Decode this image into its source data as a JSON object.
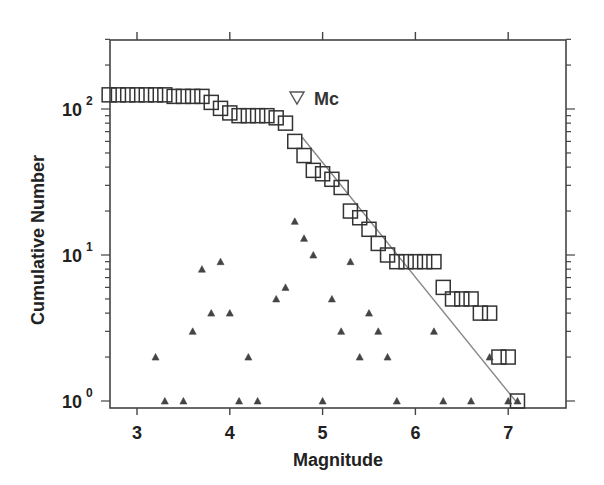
{
  "chart_data": {
    "type": "scatter",
    "title": "",
    "xlabel": "Magnitude",
    "ylabel": "Cumulative Number",
    "yscale": "log",
    "xlim": [
      2.7,
      7.6
    ],
    "ylim": [
      0.9,
      330
    ],
    "grid": false,
    "x_ticks": [
      3,
      4,
      5,
      6,
      7
    ],
    "x_tick_labels": [
      "3",
      "4",
      "5",
      "6",
      "7"
    ],
    "y_ticks": [
      1,
      10,
      100
    ],
    "y_tick_labels": [
      {
        "base": "10",
        "exp": "0"
      },
      {
        "base": "10",
        "exp": "1"
      },
      {
        "base": "10",
        "exp": "2"
      }
    ],
    "annotations": [
      {
        "text": "Mc",
        "marker": "open-down-triangle",
        "x": 4.72,
        "y": 140
      }
    ],
    "series": [
      {
        "name": "Cumulative number",
        "marker": "open-square",
        "color": "#333333",
        "x": [
          2.7,
          2.8,
          2.9,
          3.0,
          3.1,
          3.2,
          3.3,
          3.4,
          3.5,
          3.6,
          3.7,
          3.8,
          3.9,
          4.0,
          4.1,
          4.2,
          4.3,
          4.4,
          4.5,
          4.6,
          4.7,
          4.8,
          4.9,
          5.0,
          5.1,
          5.2,
          5.3,
          5.4,
          5.5,
          5.6,
          5.7,
          5.8,
          5.9,
          6.0,
          6.1,
          6.2,
          6.3,
          6.4,
          6.5,
          6.6,
          6.7,
          6.8,
          6.9,
          7.0,
          7.1
        ],
        "values": [
          125,
          125,
          125,
          125,
          125,
          125,
          125,
          122,
          122,
          122,
          122,
          111,
          101,
          94,
          90,
          90,
          90,
          90,
          87,
          80,
          60,
          48,
          38,
          36,
          33,
          29,
          20,
          18,
          15,
          12,
          10,
          9,
          9,
          9,
          9,
          9,
          6,
          5,
          5,
          5,
          4,
          4,
          2,
          2,
          1
        ]
      },
      {
        "name": "Non-cumulative number",
        "marker": "filled-triangle",
        "color": "#444444",
        "x": [
          3.2,
          3.3,
          3.5,
          3.6,
          3.7,
          3.8,
          3.9,
          4.0,
          4.1,
          4.2,
          4.3,
          4.5,
          4.6,
          4.7,
          4.8,
          4.9,
          5.0,
          5.1,
          5.2,
          5.3,
          5.4,
          5.5,
          5.6,
          5.7,
          5.8,
          6.2,
          6.3,
          6.6,
          6.8,
          7.0,
          7.1
        ],
        "values": [
          2,
          1,
          1,
          3,
          8,
          4,
          9,
          4,
          1,
          2,
          1,
          5,
          6,
          17,
          13,
          10,
          1,
          5,
          3,
          9,
          2,
          4,
          3,
          2,
          1,
          3,
          1,
          1,
          2,
          1,
          1
        ]
      },
      {
        "name": "Gutenberg-Richter fit",
        "marker": "line",
        "color": "#888888",
        "x": [
          4.78,
          7.08
        ],
        "values": [
          64,
          1
        ]
      }
    ]
  }
}
